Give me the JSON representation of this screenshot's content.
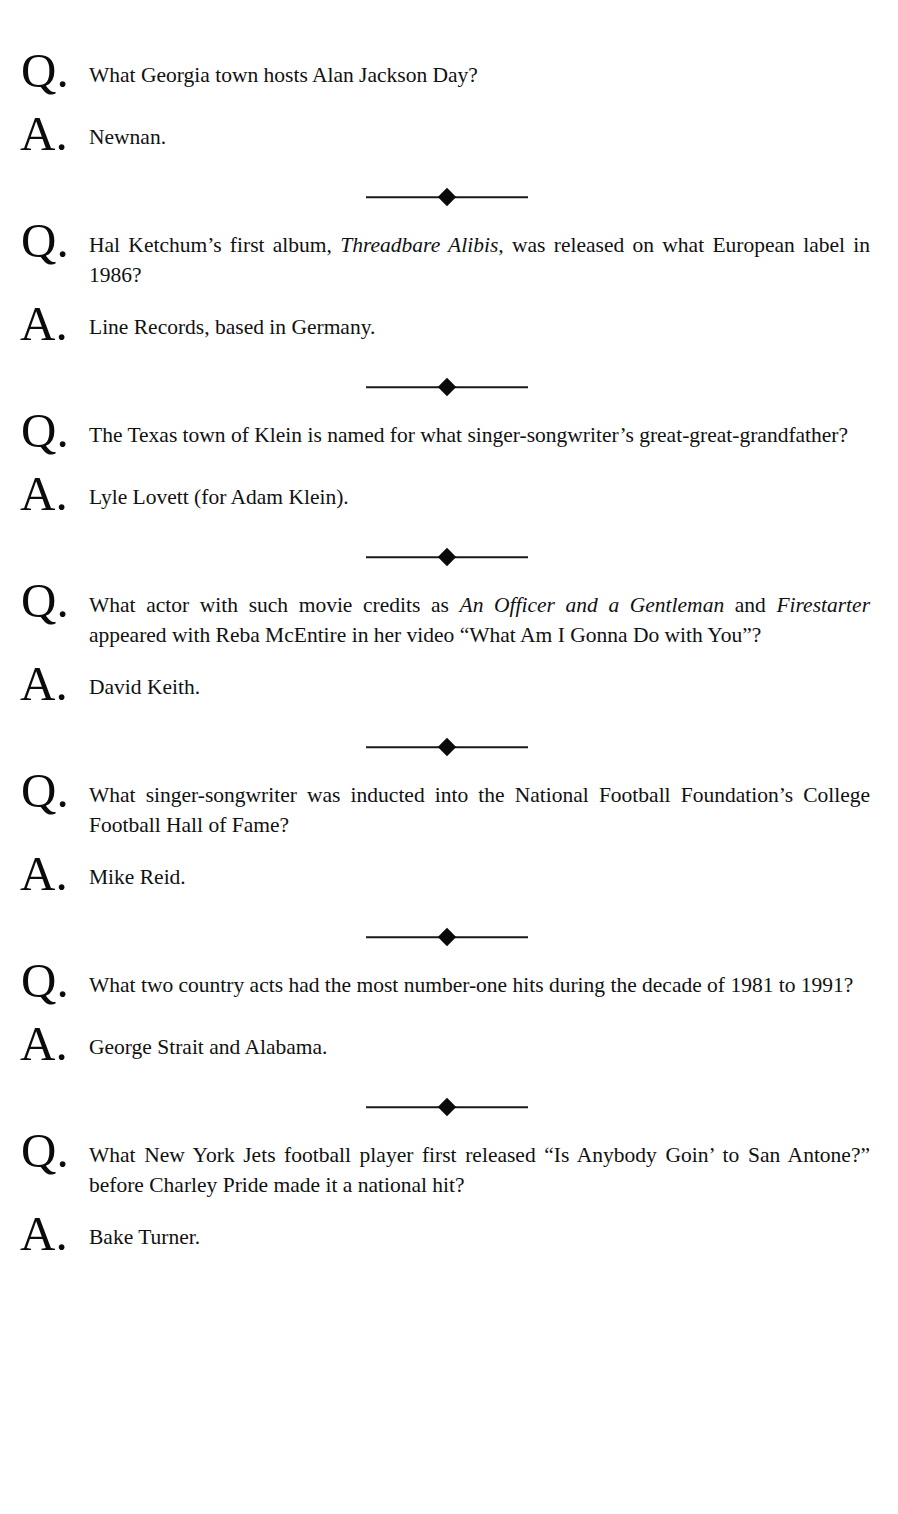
{
  "page": {
    "background_color": "#ffffff",
    "text_color": "#111111",
    "running_head": "",
    "ornament_glyph": "diamond-rule"
  },
  "entries": [
    {
      "q_marker": "Q.",
      "a_marker": "A.",
      "question_html": "What Georgia town hosts Alan Jackson Day?",
      "question_text": "What Georgia town hosts Alan Jackson Day?",
      "answer_html": "Newnan.",
      "answer_text": "Newnan.",
      "question_lines": 1,
      "has_ornament": true
    },
    {
      "q_marker": "Q.",
      "a_marker": "A.",
      "question_html": "Hal Ketchum’s first album, <i>Threadbare Alibis,</i> was released on what European label in 1986?",
      "question_text": "Hal Ketchum’s first album, Threadbare Alibis, was released on what European label in 1986?",
      "answer_html": "Line Records, based in Germany.",
      "answer_text": "Line Records, based in Germany.",
      "question_lines": 2,
      "has_ornament": true
    },
    {
      "q_marker": "Q.",
      "a_marker": "A.",
      "question_html": "The Texas town of Klein is named for what singer-songwriter’s great-great-grandfather?",
      "question_text": "The Texas town of Klein is named for what singer-songwriter’s great-great-grandfather?",
      "answer_html": "Lyle Lovett (for Adam Klein).",
      "answer_text": "Lyle Lovett (for Adam Klein).",
      "question_lines": 2,
      "has_ornament": true
    },
    {
      "q_marker": "Q.",
      "a_marker": "A.",
      "question_html": "What actor with such movie credits as <i>An Officer and a Gentleman</i> and <i>Firestarter</i> appeared with Reba McEntire in her video “What Am I Gonna Do with You”?",
      "question_text": "What actor with such movie credits as An Officer and a Gentleman and Firestarter appeared with Reba McEntire in her video “What Am I Gonna Do with You”?",
      "answer_html": "David Keith.",
      "answer_text": "David Keith.",
      "question_lines": 3,
      "has_ornament": true
    },
    {
      "q_marker": "Q.",
      "a_marker": "A.",
      "question_html": "What singer-songwriter was inducted into the National Football Foundation’s College Football Hall of Fame?",
      "question_text": "What singer-songwriter was inducted into the National Football Foundation’s College Football Hall of Fame?",
      "answer_html": "Mike Reid.",
      "answer_text": "Mike Reid.",
      "question_lines": 2,
      "has_ornament": true
    },
    {
      "q_marker": "Q.",
      "a_marker": "A.",
      "question_html": "What two country acts had the most number-one hits during the decade of 1981 to 1991?",
      "question_text": "What two country acts had the most number-one hits during the decade of 1981 to 1991?",
      "answer_html": "George Strait and Alabama.",
      "answer_text": "George Strait and Alabama.",
      "question_lines": 2,
      "has_ornament": true
    },
    {
      "q_marker": "Q.",
      "a_marker": "A.",
      "question_html": "What New York Jets football player first released “Is Anybody Goin’ to San Antone?” before Charley Pride made it a national hit?",
      "question_text": "What New York Jets football player first released “Is Anybody Goin’ to San Antone?” before Charley Pride made it a national hit?",
      "answer_html": "Bake Turner.",
      "answer_text": "Bake Turner.",
      "question_lines": 2,
      "has_ornament": false
    }
  ]
}
